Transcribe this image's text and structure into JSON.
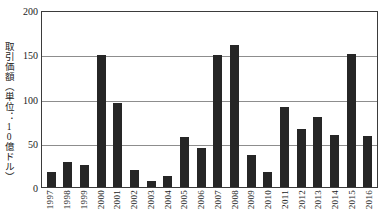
{
  "chart_data": {
    "type": "bar",
    "title": "",
    "subtitle": "",
    "xlabel": "",
    "ylabel": "取引価額（単位：10億ドル）",
    "ylim": [
      0,
      200
    ],
    "yticks": [
      0,
      50,
      100,
      150,
      200
    ],
    "ytick_labels": [
      "0",
      "50",
      "100",
      "150",
      "200"
    ],
    "grid": true,
    "legend": null,
    "legend_position": "none",
    "bar_color": "#262626",
    "categories": [
      "1997",
      "1998",
      "1999",
      "2000",
      "2001",
      "2002",
      "2003",
      "2004",
      "2005",
      "2006",
      "2007",
      "2008",
      "2009",
      "2010",
      "2011",
      "2012",
      "2013",
      "2014",
      "2015",
      "2016"
    ],
    "values": [
      17,
      28,
      25,
      149,
      95,
      19,
      7,
      12,
      56,
      44,
      149,
      161,
      36,
      17,
      90,
      66,
      79,
      59,
      150,
      58
    ]
  }
}
